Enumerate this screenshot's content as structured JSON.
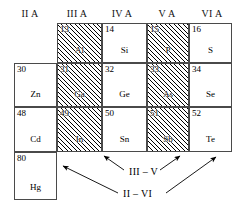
{
  "figure": {
    "colors": {
      "hatch_fill": "#000000",
      "dot_fill": "#4d4d4d",
      "plain_fill": "#ffffff",
      "border": "#4a4a4a",
      "text": "#000000"
    }
  },
  "column_headers": [
    {
      "label": "II A",
      "fill": "dot"
    },
    {
      "label": "III A",
      "fill": "hatch"
    },
    {
      "label": "IV A",
      "fill": "none"
    },
    {
      "label": "V A",
      "fill": "hatch"
    },
    {
      "label": "VI A",
      "fill": "dot"
    }
  ],
  "elements": [
    {
      "number": "13",
      "symbol": "Al",
      "group": "III A",
      "row": 1,
      "fill": "hatch"
    },
    {
      "number": "14",
      "symbol": "Si",
      "group": "IV A",
      "row": 1,
      "fill": "none"
    },
    {
      "number": "15",
      "symbol": "P",
      "group": "V A",
      "row": 1,
      "fill": "hatch"
    },
    {
      "number": "16",
      "symbol": "S",
      "group": "VI A",
      "row": 1,
      "fill": "dot"
    },
    {
      "number": "30",
      "symbol": "Zn",
      "group": "II A",
      "row": 2,
      "fill": "dot"
    },
    {
      "number": "31",
      "symbol": "Ga",
      "group": "III A",
      "row": 2,
      "fill": "hatch"
    },
    {
      "number": "32",
      "symbol": "Ge",
      "group": "IV A",
      "row": 2,
      "fill": "none"
    },
    {
      "number": "33",
      "symbol": "As",
      "group": "V A",
      "row": 2,
      "fill": "hatch"
    },
    {
      "number": "34",
      "symbol": "Se",
      "group": "VI A",
      "row": 2,
      "fill": "dot"
    },
    {
      "number": "48",
      "symbol": "Cd",
      "group": "II A",
      "row": 3,
      "fill": "dot"
    },
    {
      "number": "49",
      "symbol": "In",
      "group": "III A",
      "row": 3,
      "fill": "hatch"
    },
    {
      "number": "50",
      "symbol": "Sn",
      "group": "IV A",
      "row": 3,
      "fill": "none"
    },
    {
      "number": "51",
      "symbol": "Sb",
      "group": "V A",
      "row": 3,
      "fill": "hatch"
    },
    {
      "number": "52",
      "symbol": "Te",
      "group": "VI A",
      "row": 3,
      "fill": "dot"
    },
    {
      "number": "80",
      "symbol": "Hg",
      "group": "II A",
      "row": 4,
      "fill": "dot"
    }
  ],
  "annotations": [
    {
      "label": "III – V",
      "points_to": [
        "Ga",
        "Sb"
      ]
    },
    {
      "label": "II – VI",
      "points_to": [
        "Hg",
        "Te"
      ]
    }
  ]
}
